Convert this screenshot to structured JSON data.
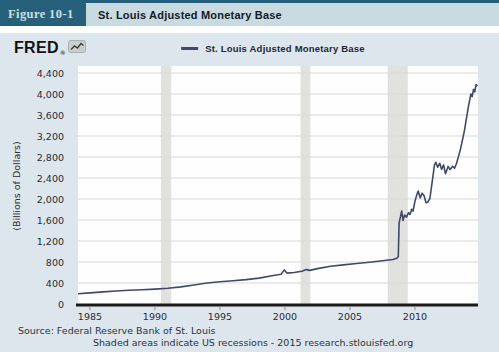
{
  "figure": {
    "label": "Figure 10-1",
    "title": "St. Louis Adjusted Monetary Base"
  },
  "brand": {
    "logo_text": "FRED",
    "logo_reg_mark": "®",
    "logo_icon": "line-chart-icon"
  },
  "legend": {
    "series_label": "St. Louis Adjusted Monetary Base"
  },
  "source": {
    "line1": "Source: Federal Reserve Bank of St. Louis",
    "line2": "Shaded areas indicate US recessions - 2015 research.stlouisfed.org"
  },
  "colors": {
    "teal_header": "#27607a",
    "figure_label_text": "#c9e0e0",
    "title_bar_bg": "#cadae1",
    "panel_bg": "#dce6ec",
    "plot_bg": "#fefefe",
    "gridline": "#d8dad5",
    "recession_band": "#e1e2de",
    "series_line": "#414968",
    "axis_line": "#1a1a1a",
    "tick_text": "#2b2b33",
    "tick_mark": "#8a8f94"
  },
  "chart_data": {
    "type": "line",
    "title": "St. Louis Adjusted Monetary Base",
    "xlabel": "",
    "ylabel": "(Billions of Dollars)",
    "xlim": [
      1984.08,
      2014.85
    ],
    "ylim": [
      0,
      4400
    ],
    "xticks": [
      1985,
      1990,
      1995,
      2000,
      2005,
      2010
    ],
    "ytick_step": 400,
    "grid": "horizontal",
    "legend_position": "top-center",
    "recession_bands": [
      [
        1990.45,
        1991.25
      ],
      [
        2001.2,
        2001.95
      ],
      [
        2007.9,
        2009.45
      ]
    ],
    "series": [
      {
        "name": "St. Louis Adjusted Monetary Base",
        "points": [
          [
            1984.08,
            195
          ],
          [
            1985,
            212
          ],
          [
            1986,
            230
          ],
          [
            1987,
            247
          ],
          [
            1988,
            262
          ],
          [
            1989,
            272
          ],
          [
            1990,
            284
          ],
          [
            1991,
            300
          ],
          [
            1992,
            326
          ],
          [
            1993,
            362
          ],
          [
            1994,
            400
          ],
          [
            1995,
            425
          ],
          [
            1996,
            443
          ],
          [
            1997,
            465
          ],
          [
            1998,
            494
          ],
          [
            1999,
            538
          ],
          [
            1999.7,
            565
          ],
          [
            1999.95,
            650
          ],
          [
            2000.15,
            588
          ],
          [
            2000.7,
            600
          ],
          [
            2001.3,
            625
          ],
          [
            2001.65,
            655
          ],
          [
            2001.9,
            640
          ],
          [
            2002.5,
            675
          ],
          [
            2003.5,
            718
          ],
          [
            2004.5,
            745
          ],
          [
            2005.5,
            772
          ],
          [
            2006.5,
            797
          ],
          [
            2007.5,
            822
          ],
          [
            2008.3,
            848
          ],
          [
            2008.6,
            872
          ],
          [
            2008.72,
            905
          ],
          [
            2008.78,
            1545
          ],
          [
            2008.88,
            1655
          ],
          [
            2008.98,
            1772
          ],
          [
            2009.08,
            1590
          ],
          [
            2009.2,
            1695
          ],
          [
            2009.35,
            1655
          ],
          [
            2009.5,
            1740
          ],
          [
            2009.62,
            1705
          ],
          [
            2009.75,
            1805
          ],
          [
            2009.85,
            1770
          ],
          [
            2010.0,
            1960
          ],
          [
            2010.15,
            2085
          ],
          [
            2010.25,
            2150
          ],
          [
            2010.4,
            2020
          ],
          [
            2010.55,
            2110
          ],
          [
            2010.7,
            2060
          ],
          [
            2010.85,
            1930
          ],
          [
            2011.0,
            1945
          ],
          [
            2011.15,
            2010
          ],
          [
            2011.5,
            2650
          ],
          [
            2011.6,
            2700
          ],
          [
            2011.75,
            2605
          ],
          [
            2011.9,
            2680
          ],
          [
            2012.05,
            2565
          ],
          [
            2012.2,
            2650
          ],
          [
            2012.35,
            2480
          ],
          [
            2012.55,
            2620
          ],
          [
            2012.7,
            2560
          ],
          [
            2012.9,
            2625
          ],
          [
            2013.05,
            2585
          ],
          [
            2013.2,
            2680
          ],
          [
            2013.5,
            2950
          ],
          [
            2013.8,
            3300
          ],
          [
            2014.1,
            3750
          ],
          [
            2014.3,
            4000
          ],
          [
            2014.4,
            3950
          ],
          [
            2014.5,
            4090
          ],
          [
            2014.6,
            4040
          ],
          [
            2014.7,
            4180
          ],
          [
            2014.8,
            4150
          ]
        ]
      }
    ]
  }
}
